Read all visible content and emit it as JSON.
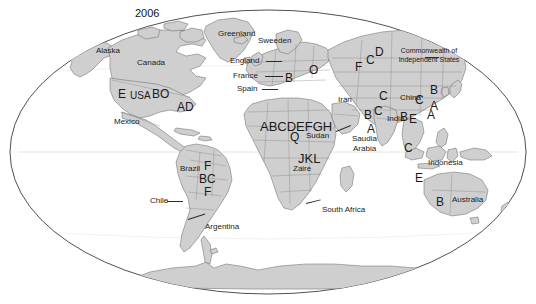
{
  "map": {
    "title": "2006",
    "projection": "globe-ellipse",
    "colors": {
      "land": "#cfcfcf",
      "land_stroke": "#6e6e6e",
      "ocean": "#ffffff",
      "globe_outline": "#3c3c3c",
      "text": "#1a1a1a",
      "graticule": "#8a8a8a"
    },
    "country_labels": [
      {
        "text": "Alaska",
        "x": 96,
        "y": 47,
        "size": "country"
      },
      {
        "text": "Canada",
        "x": 137,
        "y": 59,
        "size": "country"
      },
      {
        "text": "Greenland",
        "x": 218,
        "y": 30,
        "size": "country"
      },
      {
        "text": "Sweeden",
        "x": 258,
        "y": 37,
        "size": "country"
      },
      {
        "text": "England",
        "x": 230,
        "y": 57,
        "size": "country"
      },
      {
        "text": "France",
        "x": 233,
        "y": 72,
        "size": "country"
      },
      {
        "text": "Spain",
        "x": 237,
        "y": 85,
        "size": "country"
      },
      {
        "text": "Mexico",
        "x": 114,
        "y": 118,
        "size": "country"
      },
      {
        "text": "Iran",
        "x": 338,
        "y": 96,
        "size": "country"
      },
      {
        "text": "China",
        "x": 400,
        "y": 94,
        "size": "country"
      },
      {
        "text": "India",
        "x": 387,
        "y": 115,
        "size": "country"
      },
      {
        "text": "Sudan",
        "x": 306,
        "y": 132,
        "size": "country"
      },
      {
        "text": "Saudia",
        "x": 352,
        "y": 135,
        "size": "country"
      },
      {
        "text": "Arabia",
        "x": 353,
        "y": 145,
        "size": "country"
      },
      {
        "text": "Zaire",
        "x": 293,
        "y": 165,
        "size": "country"
      },
      {
        "text": "Indonesia",
        "x": 428,
        "y": 159,
        "size": "country"
      },
      {
        "text": "Australia",
        "x": 452,
        "y": 196,
        "size": "country"
      },
      {
        "text": "South Africa",
        "x": 322,
        "y": 206,
        "size": "country"
      },
      {
        "text": "Brazil",
        "x": 180,
        "y": 165,
        "size": "country"
      },
      {
        "text": "Chile",
        "x": 150,
        "y": 197,
        "size": "country"
      },
      {
        "text": "Argentina",
        "x": 205,
        "y": 223,
        "size": "country"
      }
    ],
    "cis_label": {
      "text": "Commonwealth of Independent States",
      "x": 388,
      "y": 46
    },
    "code_labels": [
      {
        "text": "E",
        "x": 118,
        "y": 88,
        "size": "code"
      },
      {
        "text": "USA",
        "x": 130,
        "y": 91,
        "size": "code-sm"
      },
      {
        "text": "BO",
        "x": 152,
        "y": 88,
        "size": "code"
      },
      {
        "text": "AD",
        "x": 177,
        "y": 101,
        "size": "code"
      },
      {
        "text": "B",
        "x": 285,
        "y": 72,
        "size": "code"
      },
      {
        "text": "O",
        "x": 309,
        "y": 64,
        "size": "code"
      },
      {
        "text": "F",
        "x": 355,
        "y": 61,
        "size": "code"
      },
      {
        "text": "C",
        "x": 366,
        "y": 54,
        "size": "code"
      },
      {
        "text": "D",
        "x": 375,
        "y": 46,
        "size": "code"
      },
      {
        "text": "C",
        "x": 379,
        "y": 90,
        "size": "code"
      },
      {
        "text": "B",
        "x": 364,
        "y": 109,
        "size": "code"
      },
      {
        "text": "C",
        "x": 374,
        "y": 105,
        "size": "code"
      },
      {
        "text": "A",
        "x": 367,
        "y": 123,
        "size": "code"
      },
      {
        "text": "B",
        "x": 400,
        "y": 111,
        "size": "code"
      },
      {
        "text": "E",
        "x": 409,
        "y": 113,
        "size": "code"
      },
      {
        "text": "A",
        "x": 427,
        "y": 109,
        "size": "code"
      },
      {
        "text": "B",
        "x": 430,
        "y": 84,
        "size": "code"
      },
      {
        "text": "C",
        "x": 415,
        "y": 94,
        "size": "code"
      },
      {
        "text": "A",
        "x": 430,
        "y": 100,
        "size": "code"
      },
      {
        "text": "C",
        "x": 404,
        "y": 142,
        "size": "code"
      },
      {
        "text": "E",
        "x": 415,
        "y": 172,
        "size": "code"
      },
      {
        "text": "B",
        "x": 436,
        "y": 196,
        "size": "code"
      },
      {
        "text": "ABCDEFGH",
        "x": 260,
        "y": 120,
        "size": "code-lg"
      },
      {
        "text": "Q",
        "x": 290,
        "y": 131,
        "size": "code"
      },
      {
        "text": "JKL",
        "x": 298,
        "y": 152,
        "size": "code-lg"
      },
      {
        "text": "F",
        "x": 204,
        "y": 160,
        "size": "code"
      },
      {
        "text": "BC",
        "x": 199,
        "y": 173,
        "size": "code"
      },
      {
        "text": "F",
        "x": 204,
        "y": 186,
        "size": "code"
      }
    ],
    "leader_lines": [
      {
        "x": 266,
        "y": 61,
        "width": 16
      },
      {
        "x": 265,
        "y": 76,
        "width": 18
      },
      {
        "x": 262,
        "y": 89,
        "width": 16
      },
      {
        "x": 167,
        "y": 201,
        "width": 16
      }
    ]
  }
}
